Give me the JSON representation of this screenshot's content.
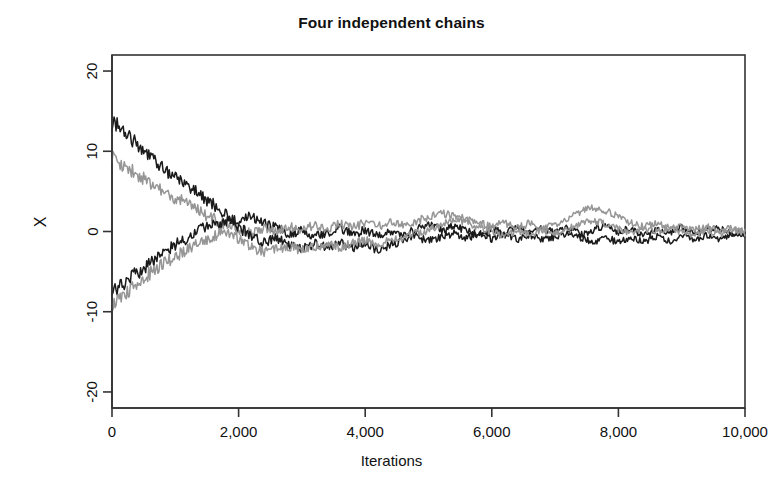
{
  "chart_data": {
    "type": "line",
    "title": "Four independent chains",
    "xlabel": "Iterations",
    "ylabel": "X",
    "xlim": [
      0,
      10000
    ],
    "ylim": [
      -22,
      22
    ],
    "grid": false,
    "legend": "none",
    "xticks": [
      0,
      2000,
      4000,
      6000,
      8000,
      10000
    ],
    "xticklabels": [
      "0",
      "2,000",
      "4,000",
      "6,000",
      "8,000",
      "10,000"
    ],
    "yticks": [
      -20,
      -10,
      0,
      10,
      20
    ],
    "yticklabels": [
      "-20",
      "-10",
      "0",
      "10",
      "20"
    ],
    "series": [
      {
        "name": "chain-1",
        "color": "#1a1a1a",
        "start_value": 13.5,
        "x": [
          0,
          100,
          200,
          300,
          400,
          500,
          600,
          700,
          800,
          900,
          1000,
          1100,
          1200,
          1300,
          1400,
          1500,
          1600,
          1700,
          1800,
          1900,
          2000,
          2200,
          2400,
          2600,
          2800,
          3000,
          3200,
          3400,
          3600,
          3800,
          4000,
          4200,
          4400,
          4600,
          4800,
          5000,
          5200,
          5400,
          5600,
          5800,
          6000,
          6200,
          6400,
          6600,
          6800,
          7000,
          7200,
          7400,
          7600,
          7800,
          8000,
          8200,
          8400,
          8600,
          8800,
          9000,
          9200,
          9400,
          9600,
          9800,
          10000
        ],
        "values": [
          13.5,
          13.2,
          12.2,
          11.5,
          11.0,
          10.1,
          9.6,
          8.6,
          8.1,
          7.3,
          6.8,
          6.4,
          5.5,
          5.2,
          4.4,
          3.9,
          3.4,
          2.6,
          2.2,
          1.6,
          1.2,
          2.0,
          1.0,
          0.4,
          -0.3,
          0.1,
          -0.7,
          -0.2,
          0.4,
          -0.4,
          0.2,
          -0.6,
          0.1,
          -0.5,
          0.3,
          0.9,
          0.2,
          0.8,
          0.1,
          -0.4,
          0.3,
          -0.2,
          0.6,
          -0.3,
          0.4,
          -0.2,
          0.5,
          -0.4,
          0.2,
          0.7,
          -0.1,
          0.4,
          -0.5,
          0.3,
          -0.2,
          0.6,
          -0.3,
          0.1,
          0.5,
          -0.2,
          0.1
        ]
      },
      {
        "name": "chain-2",
        "color": "#969696",
        "start_value": 9.1,
        "x": [
          0,
          100,
          200,
          300,
          400,
          500,
          600,
          700,
          800,
          900,
          1000,
          1100,
          1200,
          1300,
          1400,
          1500,
          1600,
          1700,
          1800,
          1900,
          2000,
          2200,
          2400,
          2600,
          2800,
          3000,
          3200,
          3400,
          3600,
          3800,
          4000,
          4200,
          4400,
          4600,
          4800,
          5000,
          5200,
          5400,
          5600,
          5800,
          6000,
          6200,
          6400,
          6600,
          6800,
          7000,
          7200,
          7400,
          7600,
          7800,
          8000,
          8200,
          8400,
          8600,
          8800,
          9000,
          9200,
          9400,
          9600,
          9800,
          10000
        ],
        "values": [
          9.1,
          8.6,
          8.3,
          7.6,
          7.0,
          6.7,
          6.0,
          5.6,
          5.0,
          4.6,
          4.1,
          3.8,
          3.3,
          2.8,
          2.5,
          2.0,
          1.6,
          1.2,
          0.9,
          0.5,
          0.2,
          -0.3,
          0.4,
          -0.2,
          0.6,
          0.1,
          0.8,
          0.3,
          1.0,
          0.5,
          1.1,
          0.6,
          1.2,
          0.7,
          1.3,
          1.8,
          2.3,
          2.0,
          1.5,
          1.0,
          0.6,
          1.1,
          0.5,
          1.0,
          0.4,
          0.9,
          1.6,
          2.4,
          3.0,
          2.6,
          1.8,
          1.1,
          0.6,
          1.0,
          0.4,
          0.8,
          0.2,
          0.6,
          0.1,
          0.4,
          0.0
        ]
      },
      {
        "name": "chain-3",
        "color": "#1a1a1a",
        "start_value": -7.8,
        "x": [
          0,
          100,
          200,
          300,
          400,
          500,
          600,
          700,
          800,
          900,
          1000,
          1100,
          1200,
          1300,
          1400,
          1500,
          1600,
          1700,
          1800,
          1900,
          2000,
          2200,
          2400,
          2600,
          2800,
          3000,
          3200,
          3400,
          3600,
          3800,
          4000,
          4200,
          4400,
          4600,
          4800,
          5000,
          5200,
          5400,
          5600,
          5800,
          6000,
          6200,
          6400,
          6600,
          6800,
          7000,
          7200,
          7400,
          7600,
          7800,
          8000,
          8200,
          8400,
          8600,
          8800,
          9000,
          9200,
          9400,
          9600,
          9800,
          10000
        ],
        "values": [
          -7.8,
          -7.0,
          -6.5,
          -5.7,
          -5.2,
          -4.4,
          -4.0,
          -3.3,
          -2.8,
          -2.2,
          -1.7,
          -1.2,
          -0.7,
          -0.2,
          0.4,
          0.8,
          1.2,
          0.8,
          1.4,
          1.0,
          0.5,
          -0.5,
          -1.4,
          -0.8,
          -1.6,
          -2.2,
          -1.5,
          -2.0,
          -1.4,
          -2.1,
          -1.6,
          -2.3,
          -1.7,
          -1.1,
          -0.6,
          -1.2,
          -0.7,
          -0.2,
          -0.8,
          -0.3,
          -0.9,
          -0.4,
          -1.0,
          -0.5,
          -1.1,
          -0.6,
          -0.2,
          -0.8,
          -1.3,
          -0.7,
          -1.4,
          -0.8,
          -1.3,
          -0.6,
          -1.2,
          -0.5,
          -1.0,
          -0.4,
          -0.9,
          -0.3,
          -0.6
        ]
      },
      {
        "name": "chain-4",
        "color": "#969696",
        "start_value": -9.0,
        "x": [
          0,
          100,
          200,
          300,
          400,
          500,
          600,
          700,
          800,
          900,
          1000,
          1100,
          1200,
          1300,
          1400,
          1500,
          1600,
          1700,
          1800,
          1900,
          2000,
          2200,
          2400,
          2600,
          2800,
          3000,
          3200,
          3400,
          3600,
          3800,
          4000,
          4200,
          4400,
          4600,
          4800,
          5000,
          5200,
          5400,
          5600,
          5800,
          6000,
          6200,
          6400,
          6600,
          6800,
          7000,
          7200,
          7400,
          7600,
          7800,
          8000,
          8200,
          8400,
          8600,
          8800,
          9000,
          9200,
          9400,
          9600,
          9800,
          10000
        ],
        "values": [
          -9.0,
          -8.4,
          -7.7,
          -7.1,
          -6.4,
          -5.8,
          -5.2,
          -4.6,
          -4.1,
          -3.6,
          -3.1,
          -2.7,
          -2.2,
          -1.8,
          -1.4,
          -1.0,
          -0.6,
          -0.3,
          0.0,
          -0.4,
          -0.8,
          -2.0,
          -2.5,
          -2.2,
          -1.8,
          -2.4,
          -1.9,
          -1.5,
          -2.0,
          -1.5,
          -1.1,
          -1.6,
          -1.1,
          -0.7,
          -0.3,
          0.2,
          0.8,
          1.4,
          1.0,
          0.5,
          0.0,
          -0.5,
          0.1,
          -0.4,
          0.2,
          -0.3,
          0.3,
          0.9,
          1.4,
          0.9,
          0.3,
          -0.2,
          0.4,
          -0.1,
          0.5,
          0.0,
          -0.5,
          0.1,
          -0.3,
          0.2,
          -0.2
        ]
      }
    ]
  },
  "plot_box": {
    "left": 112,
    "top": 55,
    "right": 745,
    "bottom": 408
  },
  "axis_color": "#333333"
}
